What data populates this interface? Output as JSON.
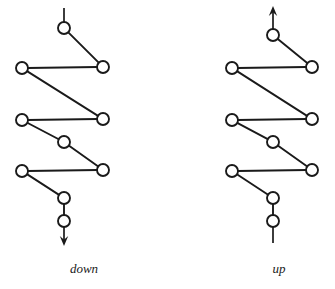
{
  "figure": {
    "background_color": "#ffffff",
    "stroke_color": "#1a1a1a",
    "node_fill_color": "#ffffff",
    "node_radius": 6,
    "stroke_width": 1.9,
    "width": 335,
    "height": 289,
    "panels": [
      {
        "id": "left-panel",
        "label": "down",
        "label_x": 84,
        "label_y": 273,
        "direction": "down",
        "arrow": {
          "type": "arrowhead",
          "position": "bottom",
          "x": 64,
          "y": 246,
          "points_toward": "down"
        },
        "nodes": [
          {
            "id": "n1",
            "x": 64,
            "y": 28
          },
          {
            "id": "n2",
            "x": 103,
            "y": 67
          },
          {
            "id": "n3",
            "x": 22,
            "y": 68
          },
          {
            "id": "n4",
            "x": 103,
            "y": 119
          },
          {
            "id": "n5",
            "x": 22,
            "y": 120
          },
          {
            "id": "n6",
            "x": 64,
            "y": 142
          },
          {
            "id": "n7",
            "x": 103,
            "y": 170
          },
          {
            "id": "n8",
            "x": 22,
            "y": 171
          },
          {
            "id": "n9",
            "x": 64,
            "y": 198
          },
          {
            "id": "n10",
            "x": 64,
            "y": 221
          }
        ],
        "edges": [
          {
            "from": "n1",
            "to": "n2"
          },
          {
            "from": "n3",
            "to": "n2"
          },
          {
            "from": "n3",
            "to": "n4"
          },
          {
            "from": "n5",
            "to": "n4"
          },
          {
            "from": "n5",
            "to": "n6"
          },
          {
            "from": "n6",
            "to": "n7"
          },
          {
            "from": "n8",
            "to": "n7"
          },
          {
            "from": "n8",
            "to": "n9"
          },
          {
            "from": "n9",
            "to": "n10"
          }
        ],
        "stubs": [
          {
            "id": "top-stub",
            "x1": 64,
            "y1": 8,
            "x2": 64,
            "y2": 22
          },
          {
            "id": "bottom-stub",
            "x1": 64,
            "y1": 227,
            "x2": 64,
            "y2": 243
          }
        ]
      },
      {
        "id": "right-panel",
        "label": "up",
        "label_x": 279,
        "label_y": 273,
        "direction": "up",
        "arrow": {
          "type": "arrowhead",
          "position": "top",
          "x": 273,
          "y": 6,
          "points_toward": "up"
        },
        "nodes": [
          {
            "id": "m1",
            "x": 273,
            "y": 35
          },
          {
            "id": "m2",
            "x": 312,
            "y": 67
          },
          {
            "id": "m3",
            "x": 232,
            "y": 68
          },
          {
            "id": "m4",
            "x": 312,
            "y": 119
          },
          {
            "id": "m5",
            "x": 232,
            "y": 120
          },
          {
            "id": "m6",
            "x": 273,
            "y": 142
          },
          {
            "id": "m7",
            "x": 312,
            "y": 170
          },
          {
            "id": "m8",
            "x": 232,
            "y": 171
          },
          {
            "id": "m9",
            "x": 273,
            "y": 198
          },
          {
            "id": "m10",
            "x": 273,
            "y": 221
          }
        ],
        "edges": [
          {
            "from": "m1",
            "to": "m2"
          },
          {
            "from": "m3",
            "to": "m2"
          },
          {
            "from": "m3",
            "to": "m4"
          },
          {
            "from": "m5",
            "to": "m4"
          },
          {
            "from": "m5",
            "to": "m6"
          },
          {
            "from": "m6",
            "to": "m7"
          },
          {
            "from": "m8",
            "to": "m7"
          },
          {
            "from": "m8",
            "to": "m9"
          },
          {
            "from": "m9",
            "to": "m10"
          }
        ],
        "stubs": [
          {
            "id": "top-stub",
            "x1": 273,
            "y1": 29,
            "x2": 273,
            "y2": 12
          },
          {
            "id": "bottom-stub",
            "x1": 273,
            "y1": 227,
            "x2": 273,
            "y2": 243
          }
        ]
      }
    ]
  }
}
